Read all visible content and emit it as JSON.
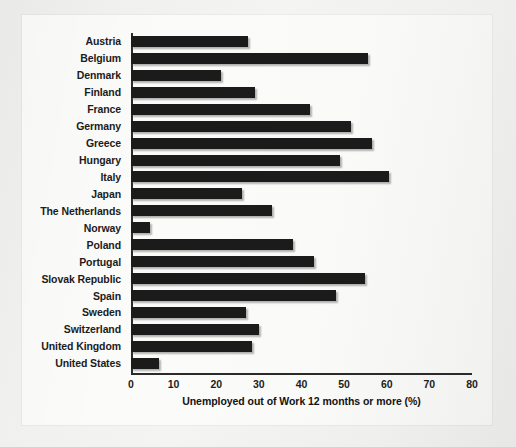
{
  "chart_data": {
    "type": "bar",
    "orientation": "horizontal",
    "title": "",
    "xlabel": "Unemployed out of Work 12 months or more (%)",
    "ylabel": "",
    "xlim": [
      0,
      80
    ],
    "xticks": [
      0,
      10,
      20,
      30,
      40,
      50,
      60,
      70,
      80
    ],
    "grid": false,
    "legend": null,
    "bar_color": "#1b1b1b",
    "background_color": "#f7f7f5",
    "categories": [
      "Austria",
      "Belgium",
      "Denmark",
      "Finland",
      "France",
      "Germany",
      "Greece",
      "Hungary",
      "Italy",
      "Japan",
      "The Netherlands",
      "Norway",
      "Poland",
      "Portugal",
      "Slovak Republic",
      "Spain",
      "Sweden",
      "Switzerland",
      "United Kingdom",
      "United States"
    ],
    "values": [
      27.5,
      55.5,
      21,
      29,
      42,
      51.5,
      56.5,
      49,
      60.5,
      26,
      33,
      4.5,
      38,
      43,
      55,
      48,
      27,
      30,
      28.5,
      6.5
    ]
  }
}
